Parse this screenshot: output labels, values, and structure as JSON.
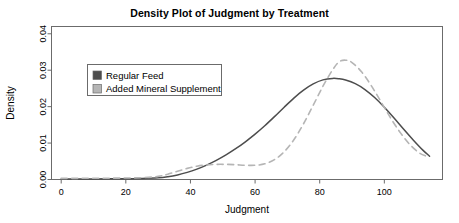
{
  "chart_data": {
    "type": "line",
    "title": "Density Plot of Judgment by Treatment",
    "xlabel": "Judgment",
    "ylabel": "Density",
    "xlim": [
      -3,
      118
    ],
    "ylim": [
      0,
      0.042
    ],
    "xticks": [
      0,
      20,
      40,
      60,
      80,
      100
    ],
    "yticks": [
      "0.00",
      "0.01",
      "0.02",
      "0.03",
      "0.04"
    ],
    "ytick_values": [
      0.0,
      0.01,
      0.02,
      0.03,
      0.04
    ],
    "grid": false,
    "legend_position": "upper-left-inside",
    "series": [
      {
        "name": "Regular Feed",
        "color": "#4d4d4d",
        "style": "solid",
        "x": [
          0,
          5,
          10,
          15,
          20,
          25,
          30,
          33,
          36,
          39,
          42,
          45,
          48,
          51,
          54,
          57,
          60,
          63,
          66,
          69,
          72,
          75,
          78,
          81,
          84,
          86,
          88,
          91,
          94,
          97,
          100,
          103,
          106,
          109,
          112,
          114
        ],
        "y": [
          0.00012,
          0.00014,
          0.00016,
          0.00018,
          0.00022,
          0.00028,
          0.00045,
          0.00075,
          0.00125,
          0.00195,
          0.00285,
          0.00395,
          0.00525,
          0.00675,
          0.00845,
          0.01035,
          0.01245,
          0.01475,
          0.01725,
          0.01985,
          0.02235,
          0.02455,
          0.02625,
          0.02735,
          0.02775,
          0.02765,
          0.0273,
          0.0263,
          0.0247,
          0.0225,
          0.01985,
          0.0169,
          0.0138,
          0.0108,
          0.008,
          0.0064
        ]
      },
      {
        "name": "Added Mineral Supplement",
        "color": "#b5b5b5",
        "style": "dashed",
        "x": [
          0,
          5,
          10,
          15,
          20,
          25,
          30,
          33,
          36,
          39,
          42,
          45,
          48,
          51,
          54,
          57,
          60,
          63,
          66,
          69,
          72,
          75,
          78,
          81,
          84,
          86,
          88,
          90,
          93,
          96,
          99,
          102,
          105,
          108,
          111,
          114
        ],
        "y": [
          0.0003,
          0.00032,
          0.00034,
          0.00036,
          0.0004,
          0.0005,
          0.00085,
          0.00145,
          0.00225,
          0.00305,
          0.00365,
          0.004,
          0.00415,
          0.00415,
          0.00405,
          0.0039,
          0.0039,
          0.0043,
          0.00545,
          0.0076,
          0.0109,
          0.0153,
          0.0204,
          0.0256,
          0.0301,
          0.0323,
          0.03275,
          0.0321,
          0.0295,
          0.0257,
          0.0213,
          0.0168,
          0.0128,
          0.0095,
          0.0072,
          0.0061
        ]
      }
    ],
    "legend_entries": [
      {
        "label": "Regular Feed",
        "color": "#4d4d4d"
      },
      {
        "label": "Added Mineral Supplement",
        "color": "#b5b5b5"
      }
    ]
  }
}
